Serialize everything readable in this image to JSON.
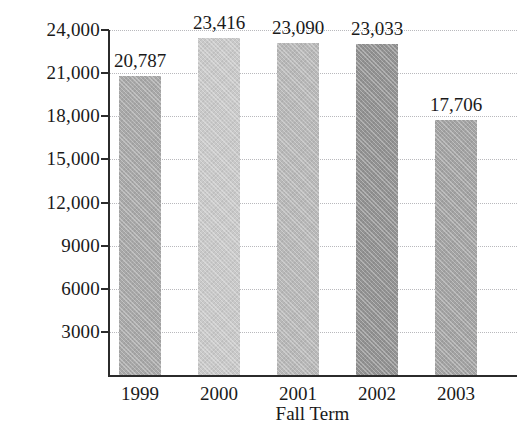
{
  "chart_data": {
    "type": "bar",
    "title": "",
    "subtitle": "",
    "xlabel": "Fall Term",
    "ylabel": "",
    "categories": [
      "1999",
      "2000",
      "2001",
      "2002",
      "2003"
    ],
    "values": [
      20787,
      23416,
      23090,
      23033,
      17706
    ],
    "value_labels": [
      "20,787",
      "23,416",
      "23,090",
      "23,033",
      "17,706"
    ],
    "bar_colors": [
      "#a8a8a8",
      "#c9c9c9",
      "#b8b8b8",
      "#929292",
      "#a3a3a3"
    ],
    "ylim": [
      0,
      24000
    ],
    "y_ticks": [
      3000,
      6000,
      9000,
      12000,
      15000,
      18000,
      21000,
      24000
    ],
    "y_tick_labels": [
      "3000",
      "6000",
      "9000",
      "12,000",
      "15,000",
      "18,000",
      "21,000",
      "24,000"
    ],
    "grid": true,
    "grid_style": "dotted",
    "grid_axis": "y",
    "legend": false,
    "legend_position": "none",
    "data_labels_shown": true,
    "axis_color": "#2b2b2b",
    "grid_color": "#b9b9bd",
    "background_color": "#ffffff"
  }
}
